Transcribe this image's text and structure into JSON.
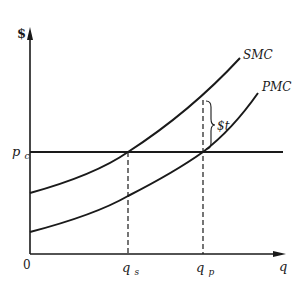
{
  "figure": {
    "type": "economics-diagram"
  },
  "axes": {
    "y_label": "$",
    "x_label": "q",
    "origin_label": "0"
  },
  "price_line": {
    "label_main": "p",
    "label_sub": "c"
  },
  "curves": [
    {
      "name": "SMC",
      "label": "SMC"
    },
    {
      "name": "PMC",
      "label": "PMC"
    }
  ],
  "quantities": [
    {
      "label_main": "q",
      "label_sub": "s"
    },
    {
      "label_main": "q",
      "label_sub": "p"
    }
  ],
  "tax": {
    "label": "$t"
  },
  "colors": {
    "ink": "#1a1a1a",
    "background": "#ffffff"
  }
}
